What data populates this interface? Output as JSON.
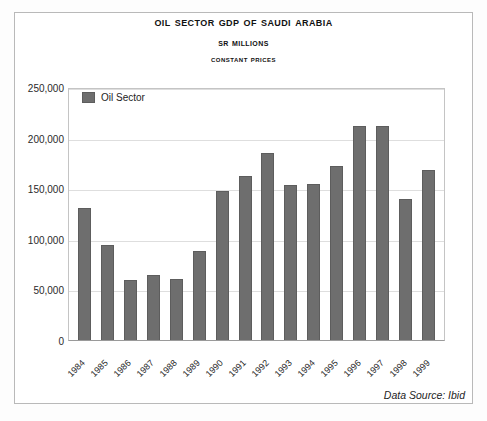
{
  "titles": {
    "main": "Oil Sector GDP of Saudi Arabia",
    "sub": "SR Millions",
    "sub2": "Constant Prices"
  },
  "legend": {
    "label": "Oil Sector",
    "swatch_color": "#6e6e6e"
  },
  "footer": {
    "source": "Data Source: Ibid"
  },
  "axis": {
    "y_ticks": [
      "0",
      "50,000",
      "100,000",
      "150,000",
      "200,000",
      "250,000"
    ]
  },
  "chart_data": {
    "type": "bar",
    "title": "Oil Sector GDP of Saudi Arabia",
    "subtitle": "SR Millions — Constant Prices",
    "xlabel": "",
    "ylabel": "SR Millions",
    "ylim": [
      0,
      250000
    ],
    "ytick_step": 50000,
    "grid": true,
    "legend_position": "top-left-inside",
    "bar_color": "#6e6e6e",
    "categories": [
      "1984",
      "1985",
      "1986",
      "1987",
      "1988",
      "1989",
      "1990",
      "1991",
      "1992",
      "1993",
      "1994",
      "1995",
      "1996",
      "1997",
      "1998",
      "1999"
    ],
    "series": [
      {
        "name": "Oil Sector",
        "values": [
          130000,
          94000,
          59000,
          64000,
          60000,
          88000,
          147000,
          162000,
          185000,
          153000,
          154000,
          172000,
          211000,
          211000,
          139000,
          168000
        ]
      }
    ],
    "annotations": [
      "Data Source: Ibid"
    ]
  }
}
